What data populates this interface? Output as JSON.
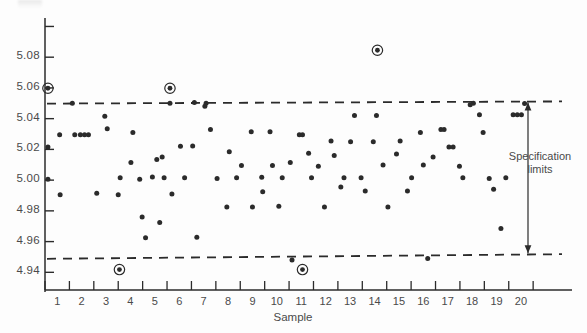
{
  "figure": {
    "background_color": "#fdfdfd",
    "ink_color": "#2b2b2b",
    "text_color": "#4a4a4a"
  },
  "annotations": {
    "spec_limits_line1": "Specification",
    "spec_limits_line2": "limits"
  },
  "chart_data": {
    "type": "scatter",
    "title": "",
    "xlabel": "Sample",
    "ylabel": "",
    "xlim": [
      0.5,
      21.6
    ],
    "ylim": [
      4.9285,
      5.1055
    ],
    "grid": false,
    "legend": "none",
    "xticks": [
      1,
      2,
      3,
      4,
      5,
      6,
      7,
      8,
      9,
      10,
      11,
      12,
      13,
      14,
      15,
      16,
      17,
      18,
      19,
      20
    ],
    "xticklabels": [
      "1",
      "2",
      "3",
      "4",
      "5",
      "6",
      "7",
      "8",
      "9",
      "10",
      "11",
      "12",
      "13",
      "14",
      "15",
      "16",
      "17",
      "18",
      "19",
      "20"
    ],
    "yticks": [
      4.94,
      4.96,
      4.98,
      5.0,
      5.02,
      5.04,
      5.06,
      5.08,
      5.1
    ],
    "yticklabels": [
      "4.94",
      "4.96",
      "4.98",
      "5.00",
      "5.02",
      "5.04",
      "5.06",
      "5.08",
      ""
    ],
    "reference_lines": [
      {
        "name": "upper-specification-limit",
        "type": "dashed-horizontal",
        "y_left": 5.0498,
        "y_right": 5.0512
      },
      {
        "name": "lower-specification-limit",
        "type": "dashed-horizontal",
        "y_left": 4.9488,
        "y_right": 4.9518
      }
    ],
    "series": [
      {
        "name": "measurements",
        "marker": "filled-circle",
        "points": [
          [
            0.62,
            5.0215
          ],
          [
            0.62,
            5.0005
          ],
          [
            1.1,
            5.0295
          ],
          [
            1.12,
            4.9905
          ],
          [
            1.62,
            5.05
          ],
          [
            1.72,
            5.0295
          ],
          [
            1.95,
            5.0295
          ],
          [
            2.12,
            5.0295
          ],
          [
            2.28,
            5.0295
          ],
          [
            2.62,
            4.9915
          ],
          [
            2.95,
            5.0415
          ],
          [
            3.05,
            5.0335
          ],
          [
            3.5,
            4.9905
          ],
          [
            3.58,
            5.0015
          ],
          [
            4.02,
            5.0115
          ],
          [
            4.1,
            5.031
          ],
          [
            4.38,
            5.0005
          ],
          [
            4.48,
            4.976
          ],
          [
            4.62,
            4.9625
          ],
          [
            4.9,
            5.002
          ],
          [
            5.08,
            5.0135
          ],
          [
            5.2,
            4.9725
          ],
          [
            5.3,
            5.015
          ],
          [
            5.38,
            5.0015
          ],
          [
            5.62,
            5.05
          ],
          [
            5.7,
            4.991
          ],
          [
            6.05,
            5.022
          ],
          [
            6.22,
            5.0015
          ],
          [
            6.55,
            5.0222
          ],
          [
            6.62,
            5.0505
          ],
          [
            6.72,
            4.9628
          ],
          [
            7.05,
            5.048
          ],
          [
            7.1,
            5.05
          ],
          [
            7.28,
            5.033
          ],
          [
            7.55,
            5.001
          ],
          [
            7.95,
            4.9825
          ],
          [
            8.05,
            5.0185
          ],
          [
            8.35,
            5.0015
          ],
          [
            8.55,
            5.0095
          ],
          [
            8.95,
            5.0315
          ],
          [
            9.0,
            4.9825
          ],
          [
            9.38,
            5.0018
          ],
          [
            9.42,
            4.9925
          ],
          [
            9.72,
            5.0315
          ],
          [
            9.82,
            5.0095
          ],
          [
            10.08,
            4.983
          ],
          [
            10.22,
            5.0015
          ],
          [
            10.55,
            5.0115
          ],
          [
            10.62,
            4.948
          ],
          [
            10.92,
            5.0295
          ],
          [
            11.05,
            5.0295
          ],
          [
            11.3,
            5.0175
          ],
          [
            11.42,
            5.0015
          ],
          [
            11.7,
            5.009
          ],
          [
            11.95,
            4.9825
          ],
          [
            12.22,
            5.0255
          ],
          [
            12.35,
            5.016
          ],
          [
            12.62,
            4.9955
          ],
          [
            12.75,
            5.0015
          ],
          [
            13.02,
            5.025
          ],
          [
            13.18,
            5.042
          ],
          [
            13.45,
            5.0015
          ],
          [
            13.62,
            4.993
          ],
          [
            13.95,
            5.025
          ],
          [
            14.08,
            5.042
          ],
          [
            14.35,
            5.0098
          ],
          [
            14.55,
            4.9825
          ],
          [
            14.9,
            5.017
          ],
          [
            15.05,
            5.0255
          ],
          [
            15.35,
            4.993
          ],
          [
            15.52,
            5.0015
          ],
          [
            15.88,
            5.031
          ],
          [
            16.0,
            5.0098
          ],
          [
            16.18,
            4.949
          ],
          [
            16.4,
            5.015
          ],
          [
            16.72,
            5.033
          ],
          [
            16.85,
            5.033
          ],
          [
            17.05,
            5.0215
          ],
          [
            17.22,
            5.0215
          ],
          [
            17.48,
            5.009
          ],
          [
            17.62,
            5.0015
          ],
          [
            17.92,
            5.049
          ],
          [
            18.05,
            5.05
          ],
          [
            18.3,
            5.0425
          ],
          [
            18.45,
            5.031
          ],
          [
            18.7,
            5.001
          ],
          [
            18.88,
            4.994
          ],
          [
            19.18,
            4.9685
          ],
          [
            19.38,
            5.0015
          ],
          [
            19.68,
            5.0425
          ],
          [
            19.85,
            5.0425
          ],
          [
            20.02,
            5.0425
          ],
          [
            20.15,
            5.0498
          ]
        ]
      },
      {
        "name": "out-of-spec-circled-points",
        "marker": "circled-dot",
        "points": [
          [
            0.62,
            5.0598
          ],
          [
            3.55,
            4.9418
          ],
          [
            5.62,
            5.0598
          ],
          [
            11.05,
            4.9418
          ],
          [
            14.12,
            5.0845
          ]
        ]
      }
    ]
  }
}
